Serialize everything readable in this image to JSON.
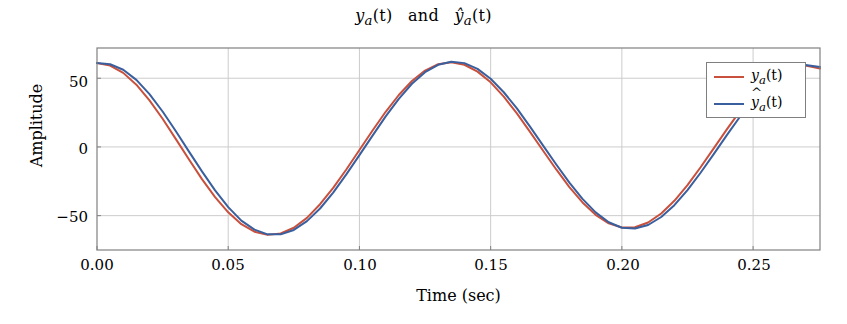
{
  "chart_data": {
    "type": "line",
    "title_parts": {
      "first": "y",
      "first_sub": "a",
      "first_arg": "(t)",
      "conjunction": "and",
      "second": "ŷ",
      "second_sub": "a",
      "second_arg": "(t)"
    },
    "xlabel": "Time (sec)",
    "ylabel": "Amplitude",
    "xlim": [
      0.0,
      0.2755
    ],
    "ylim": [
      -75.0,
      72.0
    ],
    "xticks": [
      0.0,
      0.05,
      0.1,
      0.15,
      0.2,
      0.25
    ],
    "xtick_labels": [
      "0.00",
      "0.05",
      "0.10",
      "0.15",
      "0.20",
      "0.25"
    ],
    "yticks": [
      50,
      0,
      -50
    ],
    "ytick_labels": [
      "50",
      "0",
      "−50"
    ],
    "grid": true,
    "grid_color": "#cccccc",
    "axis_color": "#808080",
    "background": "#ffffff",
    "legend_position": "upper right",
    "series": [
      {
        "name": "y_a (t)",
        "color": "#c8503c",
        "linewidth": 2.0,
        "model": "damped-cosine",
        "amplitude_start": 61.0,
        "amplitude_end": 56.0,
        "period": 0.1005,
        "phase_deg": 0.0,
        "x": [
          0.0,
          0.005,
          0.01,
          0.015,
          0.02,
          0.025,
          0.03,
          0.035,
          0.04,
          0.045,
          0.05,
          0.055,
          0.06,
          0.065,
          0.07,
          0.075,
          0.08,
          0.085,
          0.09,
          0.095,
          0.1,
          0.105,
          0.11,
          0.115,
          0.12,
          0.125,
          0.13,
          0.135,
          0.14,
          0.145,
          0.15,
          0.155,
          0.16,
          0.165,
          0.17,
          0.175,
          0.18,
          0.185,
          0.19,
          0.195,
          0.2,
          0.205,
          0.21,
          0.215,
          0.22,
          0.225,
          0.23,
          0.235,
          0.24,
          0.245,
          0.25,
          0.255,
          0.26,
          0.265,
          0.27,
          0.2755
        ],
        "y": [
          61.0,
          59.2,
          53.9,
          45.3,
          33.9,
          20.5,
          5.9,
          -9.0,
          -23.4,
          -36.5,
          -47.6,
          -56.2,
          -61.7,
          -64.0,
          -63.0,
          -58.8,
          -51.6,
          -41.7,
          -29.8,
          -16.4,
          -2.2,
          12.0,
          25.6,
          37.8,
          48.0,
          55.6,
          60.2,
          61.6,
          59.8,
          54.8,
          47.0,
          36.6,
          24.4,
          11.0,
          -2.8,
          -16.4,
          -29.2,
          -40.4,
          -49.4,
          -55.6,
          -58.6,
          -58.4,
          -55.0,
          -48.4,
          -39.2,
          -27.8,
          -14.8,
          -1.0,
          12.8,
          26.0,
          37.8,
          47.4,
          54.4,
          58.4,
          59.2,
          57.0
        ]
      },
      {
        "name": "ŷ_a (t)",
        "color": "#3a5f9e",
        "linewidth": 2.0,
        "model": "damped-cosine",
        "amplitude_start": 61.0,
        "amplitude_end": 57.0,
        "period": 0.1005,
        "phase_deg": -7.0,
        "x": [
          0.0,
          0.005,
          0.01,
          0.015,
          0.02,
          0.025,
          0.03,
          0.035,
          0.04,
          0.045,
          0.05,
          0.055,
          0.06,
          0.065,
          0.07,
          0.075,
          0.08,
          0.085,
          0.09,
          0.095,
          0.1,
          0.105,
          0.11,
          0.115,
          0.12,
          0.125,
          0.13,
          0.135,
          0.14,
          0.145,
          0.15,
          0.155,
          0.16,
          0.165,
          0.17,
          0.175,
          0.18,
          0.185,
          0.19,
          0.195,
          0.2,
          0.205,
          0.21,
          0.215,
          0.22,
          0.225,
          0.23,
          0.235,
          0.24,
          0.245,
          0.25,
          0.255,
          0.26,
          0.265,
          0.27,
          0.2755
        ],
        "y": [
          61.0,
          60.2,
          56.2,
          48.8,
          38.4,
          25.8,
          11.6,
          -3.2,
          -17.8,
          -31.6,
          -43.8,
          -53.6,
          -60.2,
          -63.6,
          -63.6,
          -60.4,
          -54.0,
          -44.8,
          -33.2,
          -20.0,
          -6.0,
          8.2,
          22.2,
          35.0,
          46.0,
          54.4,
          59.8,
          62.0,
          61.0,
          56.8,
          49.6,
          39.8,
          28.0,
          14.8,
          1.0,
          -12.8,
          -26.0,
          -37.8,
          -47.6,
          -54.8,
          -58.8,
          -59.4,
          -56.8,
          -51.0,
          -42.4,
          -31.4,
          -18.8,
          -5.2,
          8.6,
          22.0,
          34.4,
          44.8,
          52.8,
          57.8,
          59.6,
          58.2
        ]
      }
    ]
  },
  "legend": {
    "entries": [
      {
        "label": "y_a (t)",
        "color": "#c8503c",
        "base": "y",
        "sub": "a",
        "arg": "(t)",
        "hat": false
      },
      {
        "label": "ŷ_a (t)",
        "color": "#3a5f9e",
        "base": "y",
        "sub": "a",
        "arg": "(t)",
        "hat": true
      }
    ]
  }
}
